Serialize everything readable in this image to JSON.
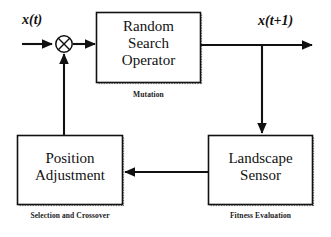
{
  "diagram": {
    "background_color": "#ffffff",
    "line_color": "#111111",
    "nodes": [
      {
        "id": "random-search-operator",
        "label": "Random\nSearch\nOperator",
        "caption": "Mutation",
        "shape": "rectangle"
      },
      {
        "id": "landscape-sensor",
        "label": "Landscape\nSensor",
        "caption": "Fitness Evaluation",
        "shape": "rectangle"
      },
      {
        "id": "position-adjustment",
        "label": "Position\nAdjustment",
        "caption": "Selection and Crossover",
        "shape": "rectangle"
      },
      {
        "id": "crossover-junction",
        "label": "",
        "caption": "",
        "shape": "circle-cross"
      }
    ],
    "signals": {
      "input": "x(t)",
      "output": "x(t+1)"
    },
    "edges": [
      {
        "from": "input",
        "to": "crossover-junction",
        "direction": "right"
      },
      {
        "from": "crossover-junction",
        "to": "random-search-operator",
        "direction": "right"
      },
      {
        "from": "random-search-operator",
        "to": "output",
        "direction": "right"
      },
      {
        "from": "output-branch",
        "to": "landscape-sensor",
        "direction": "down"
      },
      {
        "from": "landscape-sensor",
        "to": "position-adjustment",
        "direction": "left"
      },
      {
        "from": "position-adjustment",
        "to": "crossover-junction",
        "direction": "up"
      }
    ]
  }
}
